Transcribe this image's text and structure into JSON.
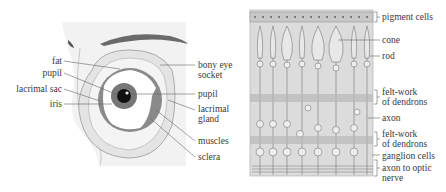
{
  "eye_diagram": {
    "left_labels": [
      {
        "text": "fat"
      },
      {
        "text": "pupil"
      },
      {
        "text": "lacrimal sac"
      },
      {
        "text": "iris"
      }
    ],
    "right_labels": [
      {
        "line1": "bony eye",
        "line2": "socket"
      },
      {
        "line1": "pupil",
        "line2": ""
      },
      {
        "line1": "lacrimal",
        "line2": "gland"
      },
      {
        "line1": "muscles",
        "line2": ""
      },
      {
        "line1": "sclera",
        "line2": ""
      }
    ]
  },
  "retina_diagram": {
    "labels": [
      {
        "line1": "pigment cells",
        "line2": ""
      },
      {
        "line1": "cone",
        "line2": ""
      },
      {
        "line1": "rod",
        "line2": ""
      },
      {
        "line1": "felt-work",
        "line2": "of dendrons"
      },
      {
        "line1": "axon",
        "line2": ""
      },
      {
        "line1": "felt-work",
        "line2": "of dendrons"
      },
      {
        "line1": "ganglion cells",
        "line2": ""
      },
      {
        "line1": "axon to optic",
        "line2": "nerve"
      }
    ]
  },
  "colors": {
    "background": "#ffffff",
    "face_shade": "#f0f0f0",
    "panel_gray": "#d9d9d9",
    "line": "#666666",
    "iris": "#777777",
    "pupil": "#111111"
  }
}
